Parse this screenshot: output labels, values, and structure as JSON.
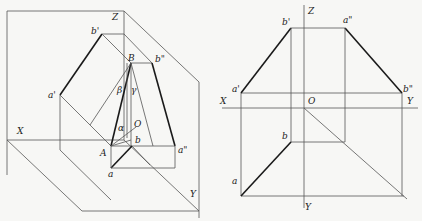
{
  "figure": {
    "left_diagram": {
      "title": "Three-plane pictorial view of line AB",
      "labels": {
        "Z": "Z",
        "X": "X",
        "Y": "Y",
        "O": "O",
        "A": "A",
        "B": "B",
        "a": "a",
        "b": "b",
        "a_prime": "a'",
        "b_prime": "b'",
        "a_dprime": "a\"",
        "b_dprime": "b\"",
        "alpha": "α",
        "beta": "β",
        "gamma": "γ"
      }
    },
    "right_diagram": {
      "title": "Orthographic projections of line AB",
      "labels": {
        "Z": "Z",
        "X": "X",
        "Y_right": "Y",
        "Y_bottom": "Y",
        "O": "O",
        "a": "a",
        "b": "b",
        "a_prime": "a'",
        "b_prime": "b'",
        "a_dprime": "a\"",
        "b_dprime": "b\""
      }
    }
  }
}
